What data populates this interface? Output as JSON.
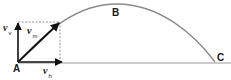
{
  "diagram": {
    "type": "projectile-motion",
    "points": {
      "A": {
        "label": "A",
        "x": 18,
        "y": 62
      },
      "B": {
        "label": "B",
        "x": 117,
        "y": 4
      },
      "C": {
        "label": "C",
        "x": 215,
        "y": 62
      }
    },
    "vectors": {
      "vertical": {
        "symbol": "v",
        "subscript": "v"
      },
      "resultant": {
        "symbol": "v",
        "subscript": "m"
      },
      "horizontal": {
        "symbol": "v",
        "subscript": "h"
      }
    },
    "colors": {
      "trajectory": "#8a8a8a",
      "vectors": "#111111",
      "ground": "#9a9a9a",
      "dashed": "#777777",
      "background": "#ffffff"
    }
  }
}
